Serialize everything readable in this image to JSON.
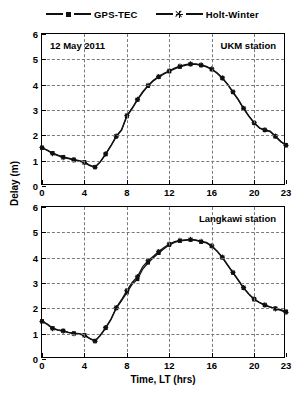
{
  "figure": {
    "legend": [
      {
        "label": "GPS-TEC",
        "marker": "square-marker",
        "color": "#111111"
      },
      {
        "label": "Holt-Winter",
        "marker": "star-marker",
        "color": "#111111"
      }
    ],
    "ylabel": "Delay (m)",
    "xlabel": "Time, LT (hrs)"
  },
  "panels": [
    {
      "id": "top",
      "annotation_left": "12 May 2011",
      "annotation_right": "UKM station"
    },
    {
      "id": "bottom",
      "annotation_left": "",
      "annotation_right": "Langkawi station"
    }
  ],
  "chart_data": [
    {
      "type": "line",
      "title": "UKM station",
      "subtitle": "12 May 2011",
      "xlabel": "Time, LT (hrs)",
      "ylabel": "Delay (m)",
      "xlim": [
        0,
        23
      ],
      "ylim": [
        0,
        6
      ],
      "xticks": [
        0,
        4,
        8,
        12,
        16,
        20,
        23
      ],
      "yticks": [
        0,
        1,
        2,
        3,
        4,
        5,
        6
      ],
      "grid": true,
      "legend_position": "top-center-outside",
      "x": [
        0,
        0.5,
        1,
        1.5,
        2,
        2.5,
        3,
        3.5,
        4,
        4.5,
        5,
        5.5,
        6,
        6.5,
        7,
        7.5,
        8,
        8.5,
        9,
        9.5,
        10,
        10.5,
        11,
        11.5,
        12,
        12.5,
        13,
        13.5,
        14,
        14.5,
        15,
        15.5,
        16,
        16.5,
        17,
        17.5,
        18,
        18.5,
        19,
        19.5,
        20,
        20.5,
        21,
        21.5,
        22,
        22.5,
        23
      ],
      "series": [
        {
          "name": "GPS-TEC",
          "values": [
            1.5,
            1.42,
            1.3,
            1.22,
            1.15,
            1.1,
            1.05,
            1.0,
            0.95,
            0.82,
            0.75,
            0.95,
            1.25,
            1.58,
            1.95,
            2.2,
            2.75,
            3.05,
            3.4,
            3.7,
            3.95,
            4.15,
            4.3,
            4.42,
            4.52,
            4.62,
            4.7,
            4.76,
            4.8,
            4.8,
            4.76,
            4.7,
            4.6,
            4.45,
            4.25,
            4.0,
            3.7,
            3.4,
            3.05,
            2.75,
            2.48,
            2.28,
            2.2,
            2.15,
            1.95,
            1.75,
            1.62
          ]
        },
        {
          "name": "Holt-Winter",
          "values": [
            1.52,
            1.4,
            1.28,
            1.2,
            1.12,
            1.08,
            1.02,
            0.98,
            0.92,
            0.8,
            0.74,
            0.96,
            1.27,
            1.6,
            1.97,
            2.22,
            2.78,
            3.08,
            3.42,
            3.72,
            3.97,
            4.17,
            4.32,
            4.45,
            4.55,
            4.65,
            4.73,
            4.79,
            4.82,
            4.82,
            4.78,
            4.72,
            4.62,
            4.47,
            4.27,
            4.02,
            3.72,
            3.42,
            3.07,
            2.77,
            2.5,
            2.3,
            2.22,
            2.17,
            1.97,
            1.77,
            1.6
          ]
        }
      ]
    },
    {
      "type": "line",
      "title": "Langkawi station",
      "subtitle": "",
      "xlabel": "Time, LT (hrs)",
      "ylabel": "Delay (m)",
      "xlim": [
        0,
        23
      ],
      "ylim": [
        0,
        6
      ],
      "xticks": [
        0,
        4,
        8,
        12,
        16,
        20,
        23
      ],
      "yticks": [
        0,
        1,
        2,
        3,
        4,
        5,
        6
      ],
      "grid": true,
      "legend_position": "top-center-outside",
      "x": [
        0,
        0.5,
        1,
        1.5,
        2,
        2.5,
        3,
        3.5,
        4,
        4.5,
        5,
        5.5,
        6,
        6.5,
        7,
        7.5,
        8,
        8.5,
        9,
        9.5,
        10,
        10.5,
        11,
        11.5,
        12,
        12.5,
        13,
        13.5,
        14,
        14.5,
        15,
        15.5,
        16,
        16.5,
        17,
        17.5,
        18,
        18.5,
        19,
        19.5,
        20,
        20.5,
        21,
        21.5,
        22,
        22.5,
        23
      ],
      "series": [
        {
          "name": "GPS-TEC",
          "values": [
            1.5,
            1.38,
            1.22,
            1.15,
            1.12,
            1.05,
            1.02,
            1.0,
            0.95,
            0.82,
            0.72,
            0.92,
            1.22,
            1.55,
            2.0,
            2.3,
            2.62,
            2.95,
            3.15,
            3.55,
            3.8,
            4.0,
            4.18,
            4.35,
            4.5,
            4.6,
            4.66,
            4.68,
            4.7,
            4.68,
            4.62,
            4.58,
            4.45,
            4.25,
            4.0,
            3.7,
            3.4,
            3.1,
            2.8,
            2.55,
            2.35,
            2.22,
            2.12,
            2.05,
            2.0,
            1.95,
            1.88
          ]
        },
        {
          "name": "Holt-Winter",
          "values": [
            1.48,
            1.36,
            1.2,
            1.14,
            1.1,
            1.04,
            1.0,
            0.98,
            0.93,
            0.8,
            0.7,
            0.94,
            1.24,
            1.58,
            2.03,
            2.34,
            2.7,
            3.02,
            3.25,
            3.65,
            3.88,
            4.06,
            4.24,
            4.4,
            4.54,
            4.63,
            4.68,
            4.7,
            4.72,
            4.7,
            4.64,
            4.6,
            4.47,
            4.27,
            4.02,
            3.72,
            3.42,
            3.12,
            2.82,
            2.57,
            2.37,
            2.24,
            2.14,
            2.06,
            1.98,
            1.92,
            1.84
          ]
        }
      ]
    }
  ]
}
